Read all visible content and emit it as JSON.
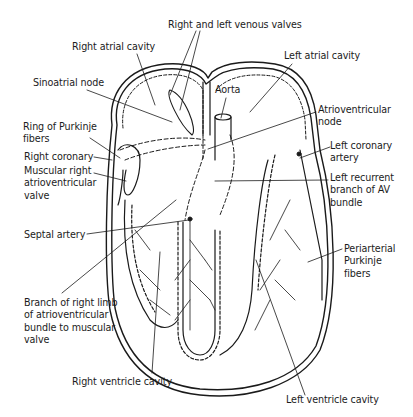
{
  "diagram": {
    "labels": [
      {
        "id": "right-left-venous-valves",
        "text": "Right and left venous valves",
        "x": 168,
        "y": 21
      },
      {
        "id": "right-atrial-cavity",
        "text": "Right atrial cavity",
        "x": 72,
        "y": 40
      },
      {
        "id": "left-atrial-cavity",
        "text": "Left atrial cavity",
        "x": 284,
        "y": 50
      },
      {
        "id": "sinoatrial-node",
        "text": "Sinoatrial node",
        "x": 33,
        "y": 78
      },
      {
        "id": "aorta",
        "text": "Aorta",
        "x": 215,
        "y": 86
      },
      {
        "id": "atrioventricular-node",
        "text": "Atrioventricular\nnode",
        "x": 318,
        "y": 106
      },
      {
        "id": "ring-of-purkinje-fibers",
        "text": "Ring of Purkinje\nfibers",
        "x": 23,
        "y": 123
      },
      {
        "id": "right-coronary",
        "text": "Right coronary",
        "x": 24,
        "y": 152
      },
      {
        "id": "left-coronary-artery",
        "text": "Left coronary\nartery",
        "x": 331,
        "y": 141
      },
      {
        "id": "muscular-right-av-valve",
        "text": "Muscular right\natrioventricular\nvalve",
        "x": 24,
        "y": 165
      },
      {
        "id": "left-recurrent-branch",
        "text": "Left recurrent\nbranch of AV\nbundle",
        "x": 330,
        "y": 172
      },
      {
        "id": "septal-artery",
        "text": "Septal artery",
        "x": 24,
        "y": 229
      },
      {
        "id": "periarterial-purkinje-fibers",
        "text": "Periarterial\nPurkinje\nfibers",
        "x": 344,
        "y": 244
      },
      {
        "id": "branch-right-limb",
        "text": "Branch of right limb\nof atrioventricular\nbundle to muscular\nvalve",
        "x": 24,
        "y": 297
      },
      {
        "id": "right-ventricle-cavity",
        "text": "Right ventricle cavity",
        "x": 72,
        "y": 376
      },
      {
        "id": "left-ventricle-cavity",
        "text": "Left ventricle cavity",
        "x": 286,
        "y": 394
      }
    ]
  },
  "colors": {
    "ink": "#1a1a1a",
    "background": "#ffffff"
  }
}
